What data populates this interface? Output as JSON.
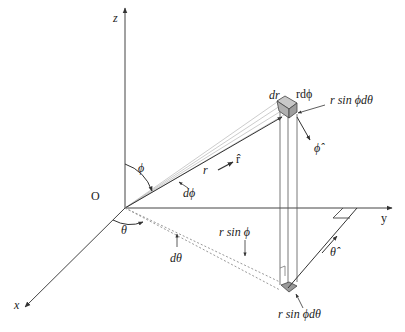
{
  "diagram": {
    "axes": {
      "z_label": "z",
      "y_label": "y",
      "x_label": "x",
      "origin_label": "O"
    },
    "angles": {
      "phi": "ϕ",
      "theta": "θ"
    },
    "labels": {
      "dr": "dr",
      "r_dphi": "rdϕ",
      "r_sin_phi_dtheta_top": "r sin ϕdθ",
      "phi_hat": "ϕ̂",
      "r_hat": "r̂",
      "r": "r",
      "dphi": "dϕ",
      "dtheta": "dθ",
      "r_sin_phi": "r sin ϕ",
      "theta_hat": "θ̂",
      "r_sin_phi_dtheta_bottom": "r sin ϕdθ"
    },
    "colors": {
      "line": "#333333",
      "shade": "#b0b0b0",
      "dotted": "#9a9a9a"
    }
  }
}
